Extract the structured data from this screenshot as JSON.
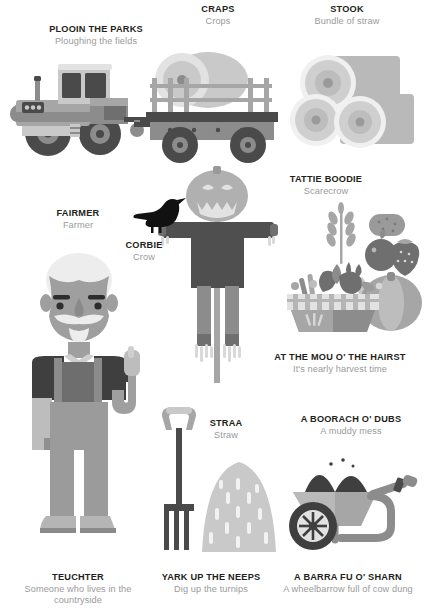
{
  "poster": {
    "title": "Scottish farming words illustrated glossary",
    "background": "#ffffff",
    "term_color": "#231f20",
    "desc_color": "#9a9a9a"
  },
  "palette": {
    "ink": "#231f20",
    "grey_dark": "#4a4a4a",
    "grey_mid": "#8c8c8c",
    "grey": "#a6a6a6",
    "grey_light": "#c9c9c9",
    "grey_pale": "#e2e2e2",
    "grey_faint": "#efefef",
    "black": "#1a1a1a"
  },
  "entries": [
    {
      "id": "plooin-the-parks",
      "term": "PLOOIN THE PARKS",
      "desc": "Ploughing the fields",
      "icon": "tractor-icon"
    },
    {
      "id": "craps",
      "term": "CRAPS",
      "desc": "Crops",
      "icon": "crop-trailer-icon"
    },
    {
      "id": "stook",
      "term": "STOOK",
      "desc": "Bundle of straw",
      "icon": "hay-bales-icon"
    },
    {
      "id": "fairmer",
      "term": "FAIRMER",
      "desc": "Farmer",
      "icon": "farmer-icon"
    },
    {
      "id": "corbie",
      "term": "CORBIE",
      "desc": "Crow",
      "icon": "crow-icon"
    },
    {
      "id": "tattie-boodie",
      "term": "TATTIE BOODIE",
      "desc": "Scarecrow",
      "icon": "scarecrow-icon"
    },
    {
      "id": "at-the-mou-o-the-hairst",
      "term": "AT THE MOU O' THE HAIRST",
      "desc": "It's nearly harvest time",
      "icon": "harvest-basket-icon"
    },
    {
      "id": "straa",
      "term": "STRAA",
      "desc": "Straw",
      "icon": "straw-pile-icon"
    },
    {
      "id": "a-boorach-o-dubs",
      "term": "A BOORACH O' DUBS",
      "desc": "A muddy mess",
      "icon": "wheelbarrow-icon"
    },
    {
      "id": "teuchter",
      "term": "TEUCHTER",
      "desc": "Someone who lives in the countryside",
      "icon": "farmer-legs-icon"
    },
    {
      "id": "yark-up-the-neeps",
      "term": "YARK UP THE NEEPS",
      "desc": "Dig up the turnips",
      "icon": "pitchfork-icon"
    },
    {
      "id": "a-barra-fu-o-sharn",
      "term": "A BARRA FU O' SHARN",
      "desc": "A wheelbarrow full of cow dung",
      "icon": "wheelbarrow-wheel-icon"
    }
  ]
}
